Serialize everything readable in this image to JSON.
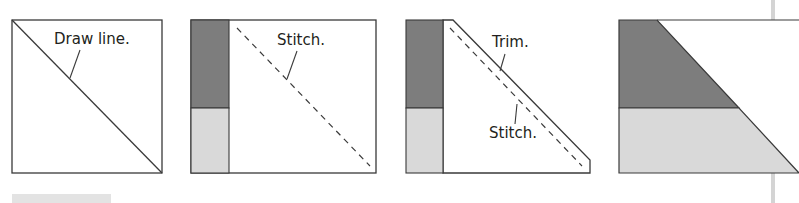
{
  "diagram": {
    "type": "quilting-steps",
    "colors": {
      "outline": "#3a3a3a",
      "dark_fabric": "#7d7d7d",
      "light_fabric": "#d9d9d9",
      "background": "#ffffff",
      "side_rule": "#d4d4d4",
      "caption_bar": "#e3e3e3"
    },
    "panels": [
      {
        "step": 1,
        "labels": {
          "draw_line": "Draw line."
        }
      },
      {
        "step": 2,
        "labels": {
          "stitch": "Stitch."
        }
      },
      {
        "step": 3,
        "labels": {
          "trim": "Trim.",
          "stitch": "Stitch."
        }
      },
      {
        "step": 4,
        "labels": {}
      }
    ]
  }
}
